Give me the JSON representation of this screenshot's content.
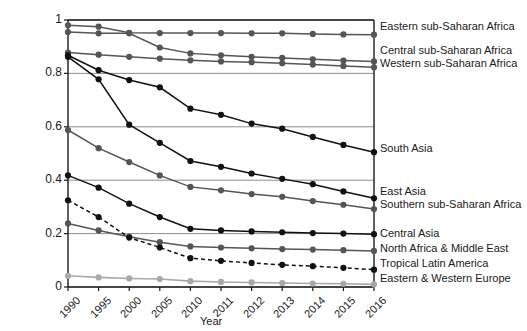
{
  "chart_data": {
    "type": "line",
    "title": "",
    "xlabel": "Year",
    "ylabel": "Proportion of population using solid fuels",
    "x": [
      "1990",
      "1995",
      "2000",
      "2005",
      "2010",
      "2011",
      "2012",
      "2013",
      "2014",
      "2015",
      "2016"
    ],
    "xtick_labels": [
      "1990",
      "1995",
      "2000",
      "2005",
      "2010",
      "2011",
      "2012",
      "2013",
      "2014",
      "2015",
      "2016"
    ],
    "ytick_labels": [
      "0",
      "0.2",
      "0.4",
      "0.6",
      "0.8",
      "1"
    ],
    "ytick_values": [
      0,
      0.2,
      0.4,
      0.6,
      0.8,
      1
    ],
    "ylim": [
      0,
      1
    ],
    "grid": "horizontal",
    "legend_position": "right-inline",
    "series": [
      {
        "name": "Eastern sub-Saharan Africa",
        "color": "#555555",
        "style": "solid",
        "values": [
          0.98,
          0.975,
          0.952,
          0.951,
          0.951,
          0.951,
          0.95,
          0.95,
          0.948,
          0.946,
          0.945
        ]
      },
      {
        "name": "Central sub-Saharan Africa",
        "color": "#555555",
        "style": "solid",
        "values": [
          0.955,
          0.95,
          0.95,
          0.897,
          0.875,
          0.868,
          0.862,
          0.858,
          0.853,
          0.848,
          0.845
        ]
      },
      {
        "name": "Western sub-Saharan Africa",
        "color": "#555555",
        "style": "solid",
        "values": [
          0.878,
          0.87,
          0.862,
          0.855,
          0.849,
          0.845,
          0.842,
          0.838,
          0.833,
          0.828,
          0.823
        ]
      },
      {
        "name": "South Asia",
        "color": "#111111",
        "style": "solid",
        "values": [
          0.868,
          0.812,
          0.775,
          0.748,
          0.668,
          0.645,
          0.612,
          0.593,
          0.562,
          0.532,
          0.505
        ]
      },
      {
        "name": "East Asia",
        "color": "#111111",
        "style": "solid",
        "values": [
          0.862,
          0.778,
          0.608,
          0.54,
          0.472,
          0.45,
          0.425,
          0.405,
          0.385,
          0.358,
          0.332
        ]
      },
      {
        "name": "Southern sub-Saharan Africa",
        "color": "#555555",
        "style": "solid",
        "values": [
          0.588,
          0.52,
          0.468,
          0.418,
          0.375,
          0.362,
          0.348,
          0.338,
          0.322,
          0.308,
          0.292
        ]
      },
      {
        "name": "Central Asia",
        "color": "#111111",
        "style": "solid",
        "values": [
          0.418,
          0.372,
          0.312,
          0.262,
          0.218,
          0.212,
          0.208,
          0.205,
          0.202,
          0.2,
          0.198
        ]
      },
      {
        "name": "North Africa & Middle East",
        "color": "#555555",
        "style": "solid",
        "values": [
          0.238,
          0.212,
          0.188,
          0.168,
          0.152,
          0.148,
          0.145,
          0.142,
          0.14,
          0.138,
          0.135
        ]
      },
      {
        "name": "Tropical Latin America",
        "color": "#111111",
        "style": "dashed",
        "values": [
          0.325,
          0.262,
          0.185,
          0.148,
          0.108,
          0.098,
          0.09,
          0.083,
          0.078,
          0.072,
          0.065
        ]
      },
      {
        "name": "Eastern & Western Europe",
        "color": "#a8a8a8",
        "style": "solid",
        "values": [
          0.042,
          0.036,
          0.032,
          0.03,
          0.022,
          0.019,
          0.017,
          0.015,
          0.013,
          0.012,
          0.01
        ]
      }
    ],
    "annotations": [
      {
        "label": "Eastern sub-Saharan Africa",
        "at_y": 0.945
      },
      {
        "label": "Central sub-Saharan Africa",
        "at_y": 0.845
      },
      {
        "label": "Western sub-Saharan Africa",
        "at_y": 0.823
      },
      {
        "label": "South Asia",
        "at_y": 0.505
      },
      {
        "label": "East Asia",
        "at_y": 0.332
      },
      {
        "label": "Southern sub-Saharan Africa",
        "at_y": 0.292
      },
      {
        "label": "Central Asia",
        "at_y": 0.198
      },
      {
        "label": "North Africa & Middle East",
        "at_y": 0.135
      },
      {
        "label": "Tropical Latin America",
        "at_y": 0.065
      },
      {
        "label": "Eastern & Western Europe",
        "at_y": 0.01
      }
    ]
  },
  "colors": {
    "dark": "#111111",
    "mid": "#555555",
    "light": "#a8a8a8",
    "grid": "#808080",
    "axis": "#1a1a1a",
    "background": "#ffffff"
  }
}
